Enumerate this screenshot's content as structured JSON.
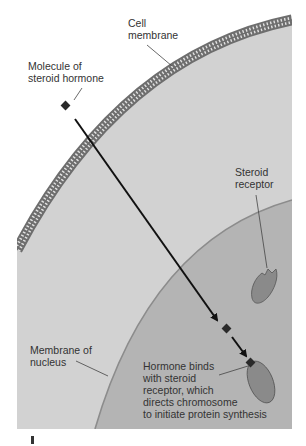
{
  "diagram": {
    "colors": {
      "background": "#ffffff",
      "cytoplasm": "#d2d2d2",
      "nucleus": "#b4b4b4",
      "nucleus_edge": "#8c8c8c",
      "membrane": "#6e6e6e",
      "membrane_inner": "#e2e2e2",
      "receptor": "#8a8a8a",
      "receptor_edge": "#555555",
      "hormone": "#2a2a2a",
      "arrow": "#111111",
      "leader": "#444444",
      "text": "#333333"
    },
    "labels": {
      "cell_membrane": "Cell\nmembrane",
      "steroid_hormone": "Molecule of\nsteroid hormone",
      "steroid_receptor": "Steroid\nreceptor",
      "nucleus_membrane": "Membrane of\nnucleus",
      "binding": "Hormone binds\nwith steroid\nreceptor, which\ndirects chromosome\nto initiate protein synthesis"
    }
  }
}
